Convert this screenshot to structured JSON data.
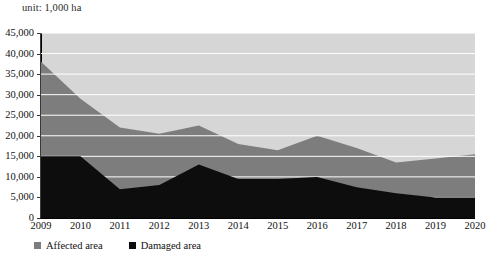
{
  "unit_note": "unit: 1,000 ha",
  "legend": {
    "position": "bottom-left",
    "items": [
      {
        "label": "Affected area",
        "color": "#7d7d7d",
        "name": "affected-area"
      },
      {
        "label": "Damaged area",
        "color": "#0d0d0d",
        "name": "damaged-area"
      }
    ]
  },
  "axes": {
    "y_ticks": [
      "0",
      "5,000",
      "10,000",
      "15,000",
      "20,000",
      "25,000",
      "30,000",
      "35,000",
      "40,000",
      "45,000"
    ],
    "x_ticks": [
      "2009",
      "2010",
      "2011",
      "2012",
      "2013",
      "2014",
      "2015",
      "2016",
      "2017",
      "2018",
      "2019",
      "2020"
    ]
  },
  "chart_data": {
    "type": "area",
    "stacked": false,
    "title": "",
    "subtitle": "",
    "xlabel": "",
    "ylabel": "",
    "unit": "1,000 ha",
    "ylim": [
      0,
      45000
    ],
    "ytick_step": 5000,
    "grid": true,
    "grid_color": "#ffffff",
    "legend_position": "bottom-left",
    "categories": [
      "2009",
      "2010",
      "2011",
      "2012",
      "2013",
      "2014",
      "2015",
      "2016",
      "2017",
      "2018",
      "2019",
      "2020"
    ],
    "x": [
      2009,
      2010,
      2011,
      2012,
      2013,
      2014,
      2015,
      2016,
      2017,
      2018,
      2019,
      2020
    ],
    "series": [
      {
        "name": "Affected area",
        "color": "#7d7d7d",
        "values": [
          38000,
          29000,
          22000,
          20500,
          22500,
          18000,
          16500,
          20000,
          17000,
          13500,
          14500,
          15500
        ]
      },
      {
        "name": "Damaged area",
        "color": "#0d0d0d",
        "values": [
          15000,
          15000,
          7000,
          8000,
          13000,
          9500,
          9500,
          10000,
          7500,
          6000,
          5000,
          5000
        ]
      }
    ],
    "plot_background": "#d6d6d6"
  }
}
